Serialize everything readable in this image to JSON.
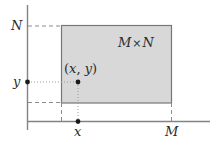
{
  "figure": {
    "kind": "cartesian-rectangle-diagram",
    "background_color": "#ffffff",
    "axis_color": "#808080",
    "rect_fill_color": "#d8d8d8",
    "rect_border_color": "#777777",
    "guide_color": "#909090",
    "point_color": "#1a1a1a",
    "text_color": "#2b2b2b"
  },
  "labels": {
    "y_axis_top": "N",
    "y_value": "y",
    "x_value": "x",
    "x_axis_right": "M",
    "region": {
      "left": "M",
      "operator": "×",
      "right": "N"
    },
    "point": {
      "open": "(",
      "x": "x",
      "comma": ",",
      "space": " ",
      "y": "y",
      "close": ")"
    }
  },
  "geometry": {
    "y_axis": {
      "x": 27,
      "y_top": 5,
      "y_bottom": 130
    },
    "x_axis": {
      "y": 121,
      "x_left": 27,
      "x_right": 210
    },
    "rectangle": {
      "left": 61,
      "top": 25,
      "right": 172,
      "bottom": 103
    },
    "point": {
      "x": 78,
      "y": 82
    },
    "tick_y": {
      "x": 27,
      "y": 82
    },
    "tick_x": {
      "x": 78,
      "y": 121
    }
  }
}
